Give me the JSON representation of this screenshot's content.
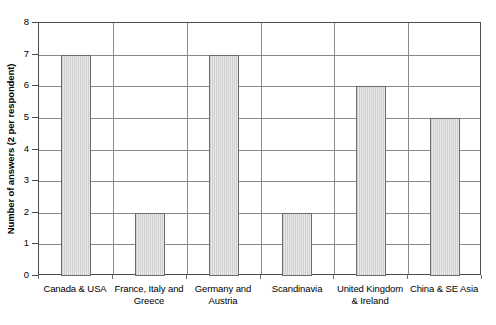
{
  "chart_data": {
    "type": "bar",
    "title": "",
    "xlabel": "",
    "ylabel": "Number of answers (2 per respondent)",
    "categories": [
      "Canada & USA",
      "France, Italy and Greece",
      "Germany and Austria",
      "Scandinavia",
      "United Kingdom & Ireland",
      "China & SE Asia"
    ],
    "category_lines": [
      [
        "Canada & USA"
      ],
      [
        "France, Italy and",
        "Greece"
      ],
      [
        "Germany and",
        "Austria"
      ],
      [
        "Scandinavia"
      ],
      [
        "United Kingdom",
        "& Ireland"
      ],
      [
        "China & SE Asia"
      ]
    ],
    "values": [
      7,
      2,
      7,
      2,
      6,
      5
    ],
    "ylim": [
      0,
      8
    ],
    "ytick_labels": [
      "0",
      "1",
      "2",
      "3",
      "4",
      "5",
      "6",
      "7",
      "8"
    ],
    "ytick_values": [
      0,
      1,
      2,
      3,
      4,
      5,
      6,
      7,
      8
    ],
    "grid": true,
    "legend": false,
    "bar_fill_color": "#dcdcdc",
    "bar_edge_color": "#6b6b6b",
    "axis_color": "#4d4d4d",
    "gridline_color": "#8a8a8a",
    "background_color": "#ffffff"
  }
}
